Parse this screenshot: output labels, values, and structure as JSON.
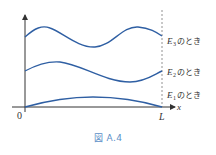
{
  "figure": {
    "caption": "図 A.4",
    "origin_label": "0",
    "end_label": "L",
    "x_axis_label": "x",
    "curves": [
      {
        "name": "E3",
        "label_main": "E",
        "label_sub": "3",
        "label_suffix": "のとき"
      },
      {
        "name": "E2",
        "label_main": "E",
        "label_sub": "2",
        "label_suffix": "のとき"
      },
      {
        "name": "E1",
        "label_main": "E",
        "label_sub": "1",
        "label_suffix": "のとき"
      }
    ],
    "colors": {
      "curve": "#2f5fa3",
      "axis": "#333333",
      "caption": "#5b8fc7"
    }
  }
}
